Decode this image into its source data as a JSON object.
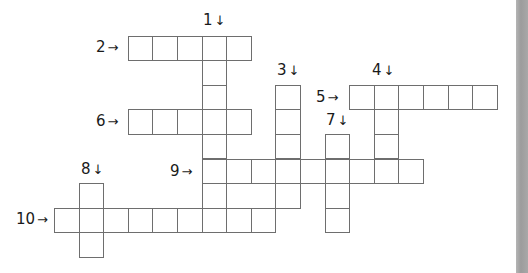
{
  "puzzle": {
    "type": "crossword",
    "grid": {
      "origin_x": 54,
      "origin_y": 35.5,
      "cell_size": 24.6
    },
    "entries": [
      {
        "number": "1",
        "direction": "down",
        "row": 0,
        "col": 6,
        "length": 8
      },
      {
        "number": "2",
        "direction": "across",
        "row": 0,
        "col": 3,
        "length": 5
      },
      {
        "number": "3",
        "direction": "down",
        "row": 2,
        "col": 9,
        "length": 5
      },
      {
        "number": "4",
        "direction": "down",
        "row": 2,
        "col": 13,
        "length": 4
      },
      {
        "number": "5",
        "direction": "across",
        "row": 2,
        "col": 12,
        "length": 6
      },
      {
        "number": "6",
        "direction": "across",
        "row": 3,
        "col": 3,
        "length": 5
      },
      {
        "number": "7",
        "direction": "down",
        "row": 4,
        "col": 11,
        "length": 4
      },
      {
        "number": "8",
        "direction": "down",
        "row": 6,
        "col": 1,
        "length": 3
      },
      {
        "number": "9",
        "direction": "across",
        "row": 5,
        "col": 6,
        "length": 9
      },
      {
        "number": "10",
        "direction": "across",
        "row": 7,
        "col": 0,
        "length": 9
      }
    ],
    "clue_labels": [
      {
        "number": "1",
        "arrow": "↓",
        "x": 203,
        "y": 13
      },
      {
        "number": "2",
        "arrow": "→",
        "x": 96,
        "y": 40
      },
      {
        "number": "3",
        "arrow": "↓",
        "x": 277,
        "y": 63
      },
      {
        "number": "4",
        "arrow": "↓",
        "x": 372,
        "y": 63
      },
      {
        "number": "5",
        "arrow": "→",
        "x": 316,
        "y": 90
      },
      {
        "number": "6",
        "arrow": "→",
        "x": 96,
        "y": 114
      },
      {
        "number": "7",
        "arrow": "↓",
        "x": 326,
        "y": 113
      },
      {
        "number": "8",
        "arrow": "↓",
        "x": 81,
        "y": 162
      },
      {
        "number": "9",
        "arrow": "→",
        "x": 170,
        "y": 164
      },
      {
        "number": "10",
        "arrow": "→",
        "x": 16,
        "y": 212
      }
    ]
  },
  "colors": {
    "cell_border": "#6e6e6e",
    "background": "#ffffff",
    "edge_strip": "#a6a6a6"
  }
}
